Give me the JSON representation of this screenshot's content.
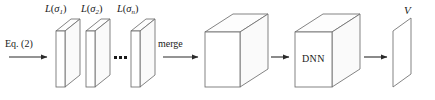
{
  "figure": {
    "type": "pipeline-diagram",
    "title": "",
    "background_color": "#ffffff",
    "stroke_color": "#6e6e6e",
    "text_color": "#1a1a1a",
    "width": 435,
    "height": 100
  },
  "labels": {
    "eq": {
      "text_prefix": "Eq.",
      "text_suffix": "(2)",
      "full": "Eq. (2)"
    },
    "merge": "merge",
    "dnn": "DNN",
    "output": "V",
    "slabs": [
      {
        "fn": "L",
        "open": "(",
        "sym": "σ",
        "sub": "1",
        "close": ")",
        "full": "L(σ1)"
      },
      {
        "fn": "L",
        "open": "(",
        "sym": "σ",
        "sub": "2",
        "close": ")",
        "full": "L(σ2)"
      },
      {
        "fn": "L",
        "open": "(",
        "sym": "σ",
        "sub": "n",
        "close": ")",
        "full": "L(σn)"
      }
    ],
    "ellipsis": "•••"
  },
  "nodes": [
    {
      "id": "slab-1",
      "kind": "thin-slab",
      "label": "L(σ1)"
    },
    {
      "id": "slab-2",
      "kind": "thin-slab",
      "label": "L(σ2)"
    },
    {
      "id": "slab-n",
      "kind": "thin-slab",
      "label": "L(σn)"
    },
    {
      "id": "merged-cube",
      "kind": "cube",
      "label": ""
    },
    {
      "id": "dnn-cube",
      "kind": "cube",
      "label": "DNN"
    },
    {
      "id": "output-plane",
      "kind": "plane",
      "label": "V"
    }
  ],
  "arrows": [
    {
      "id": "arrow-eq",
      "label": "Eq. (2)",
      "from": "input",
      "to": "slab-1"
    },
    {
      "id": "arrow-merge",
      "label": "merge",
      "from": "slab-n",
      "to": "merged-cube"
    },
    {
      "id": "arrow-cube-to-dnn",
      "label": "",
      "from": "merged-cube",
      "to": "dnn-cube"
    },
    {
      "id": "arrow-dnn-to-output",
      "label": "",
      "from": "dnn-cube",
      "to": "output-plane"
    }
  ]
}
